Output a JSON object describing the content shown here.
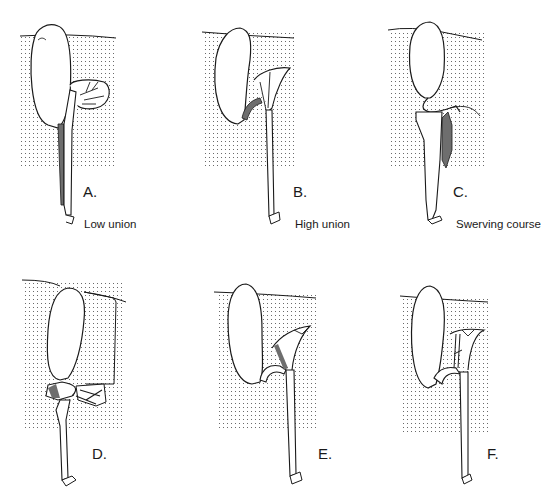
{
  "figure": {
    "panels": [
      {
        "id": "A",
        "letter": "A.",
        "caption": "Low union"
      },
      {
        "id": "B",
        "letter": "B.",
        "caption": "High union"
      },
      {
        "id": "C",
        "letter": "C.",
        "caption": "Swerving course"
      },
      {
        "id": "D",
        "letter": "D.",
        "caption": ""
      },
      {
        "id": "E",
        "letter": "E.",
        "caption": ""
      },
      {
        "id": "F",
        "letter": "F.",
        "caption": ""
      }
    ],
    "colors": {
      "line": "#1a1a1a",
      "stipple": "#555555",
      "shaded_duct": "#6e6e6e",
      "background": "#ffffff"
    }
  }
}
